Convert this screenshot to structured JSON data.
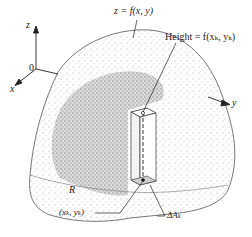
{
  "figure": {
    "type": "diagram"
  },
  "axes": {
    "z_label": "z",
    "x_label": "x",
    "y_label": "y",
    "origin_label": "0"
  },
  "labels": {
    "surface": "z = f(x, y)",
    "height": "Height = f(xₖ, yₖ)",
    "region": "R",
    "point": "(xₖ, yₖ)",
    "area_element": "ΔAₖ"
  },
  "colors": {
    "ink": "#222222",
    "surface_stipple": "#9a9a9a",
    "region_stipple": "#7a7a7a",
    "background": "#ffffff"
  }
}
